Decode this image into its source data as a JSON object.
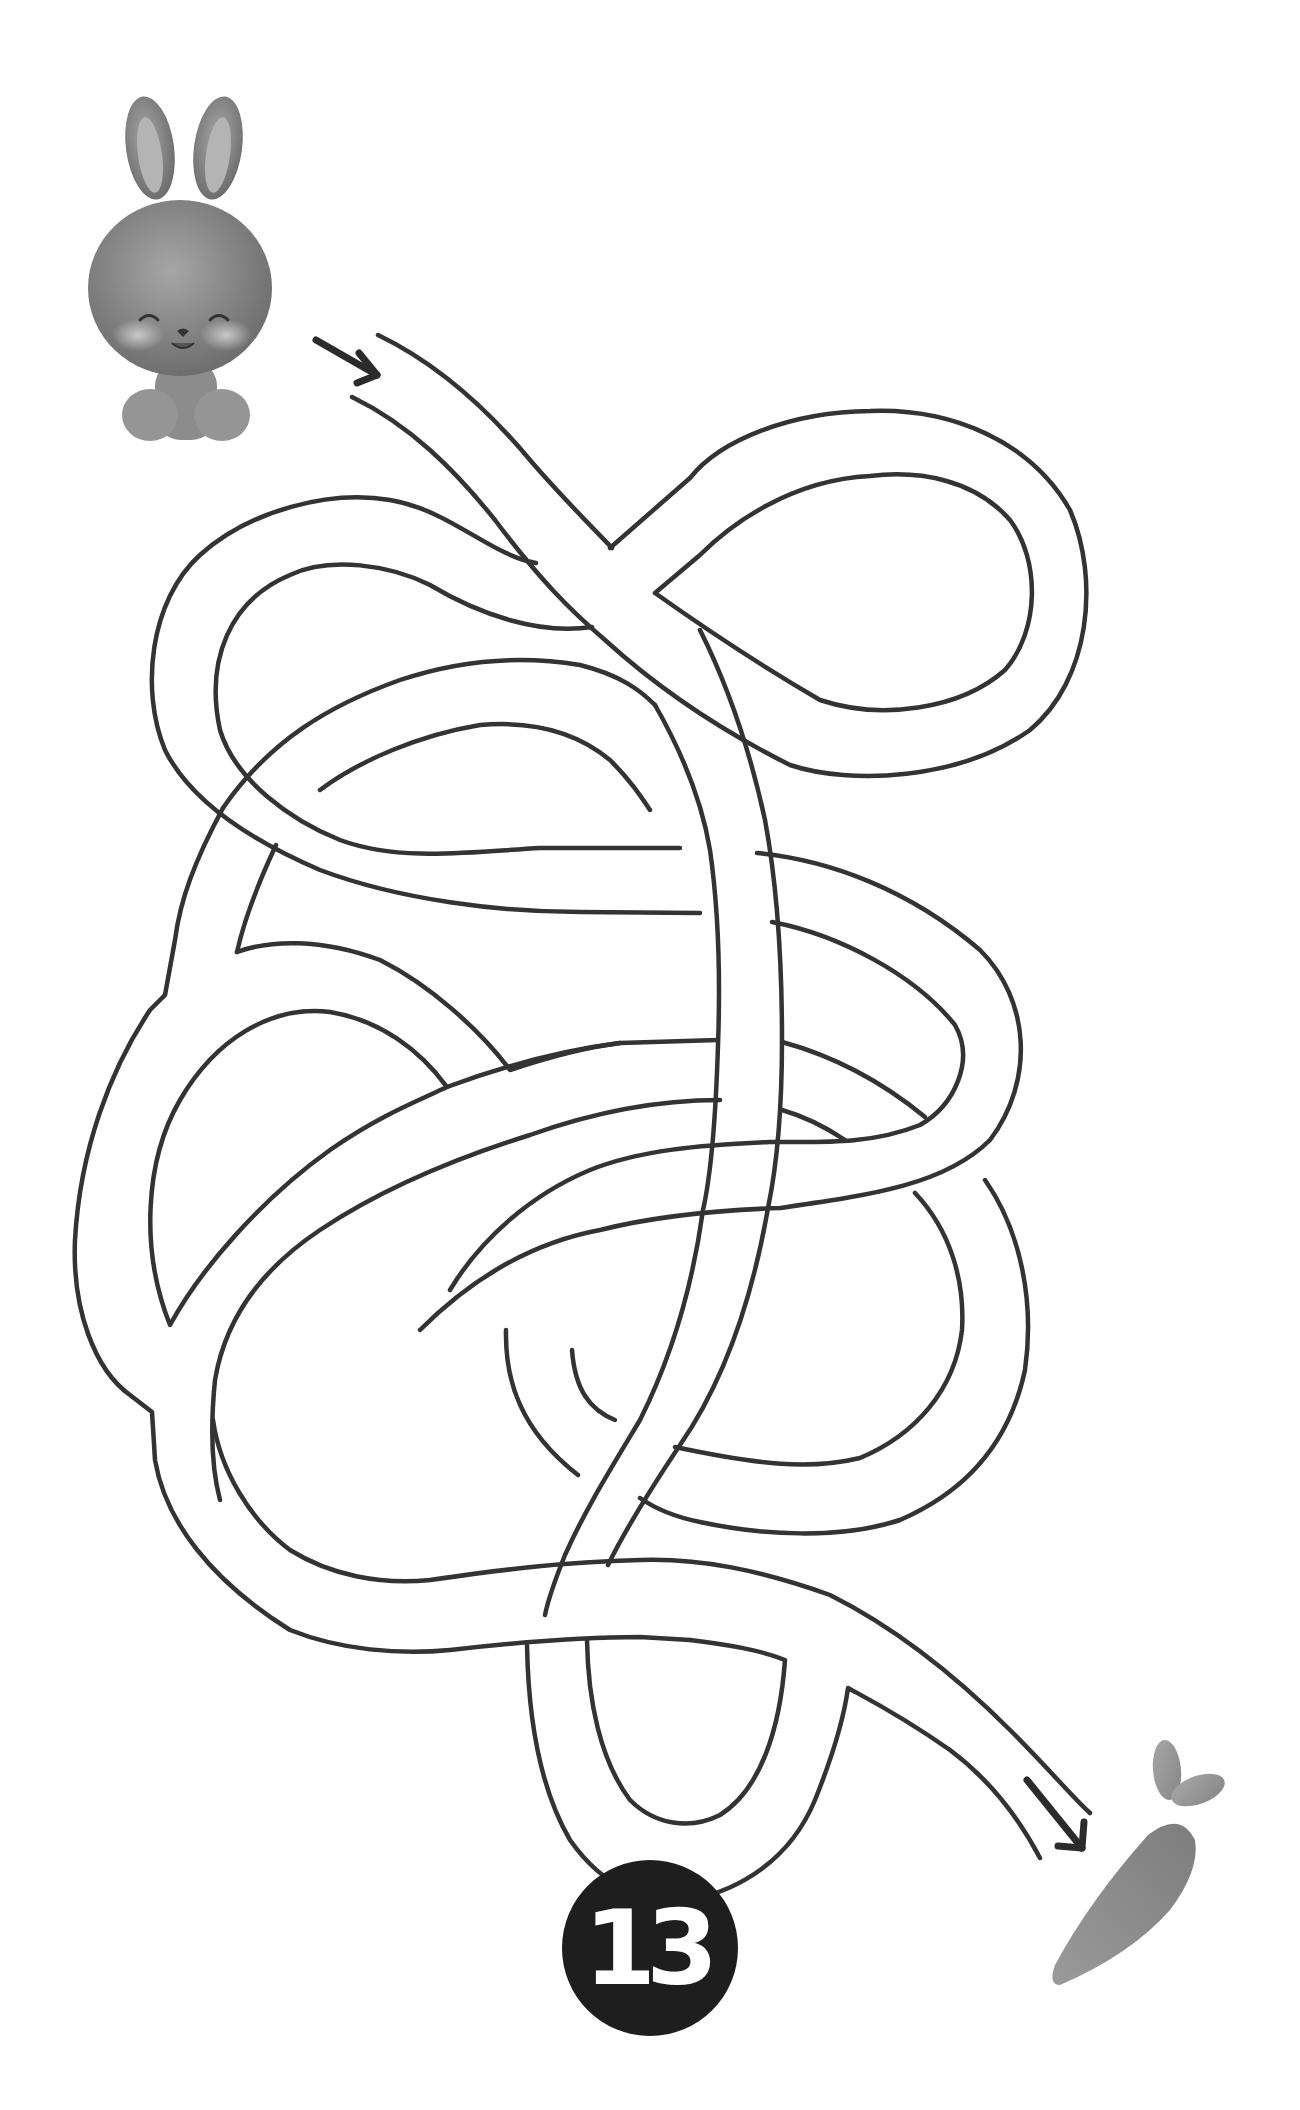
{
  "puzzle": {
    "type": "maze",
    "page_number": "13",
    "start_character": "bunny",
    "goal_item": "carrot",
    "start_arrow": "arrow-down-right",
    "end_arrow": "arrow-down-right"
  },
  "colors": {
    "line": "#333333",
    "badge_background": "#1e1e1e",
    "badge_text": "#ffffff",
    "bunny": "#8a8a8a",
    "carrot": "#8f8f8f",
    "background": "#ffffff"
  }
}
